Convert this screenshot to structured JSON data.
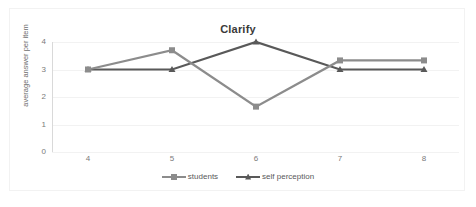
{
  "chart_data": {
    "type": "line",
    "title": "Clarify",
    "xlabel": "",
    "ylabel": "average answer per item",
    "x": [
      4,
      5,
      6,
      7,
      8
    ],
    "xticklabels": [
      "4",
      "5",
      "6",
      "7",
      "8"
    ],
    "yticklabels": [
      "4",
      "3",
      "2",
      "1",
      "0"
    ],
    "ylim": [
      0,
      4
    ],
    "yticks": [
      0,
      1,
      2,
      3,
      4
    ],
    "grid": true,
    "legend_position": "bottom",
    "series": [
      {
        "name": "students",
        "color": "#8c8c8c",
        "marker": "square",
        "values": [
          3.0,
          3.7,
          1.65,
          3.33,
          3.33
        ]
      },
      {
        "name": "self perception",
        "color": "#595959",
        "marker": "triangle",
        "values": [
          3.0,
          3.0,
          4.0,
          3.0,
          3.0
        ]
      }
    ]
  },
  "colors": {
    "students": "#8c8c8c",
    "self_perception": "#595959",
    "gridline": "#f2f2f2",
    "axis": "#d9d9d9",
    "tick_text": "#7a7a7a",
    "title_text": "#3a3a3a"
  }
}
